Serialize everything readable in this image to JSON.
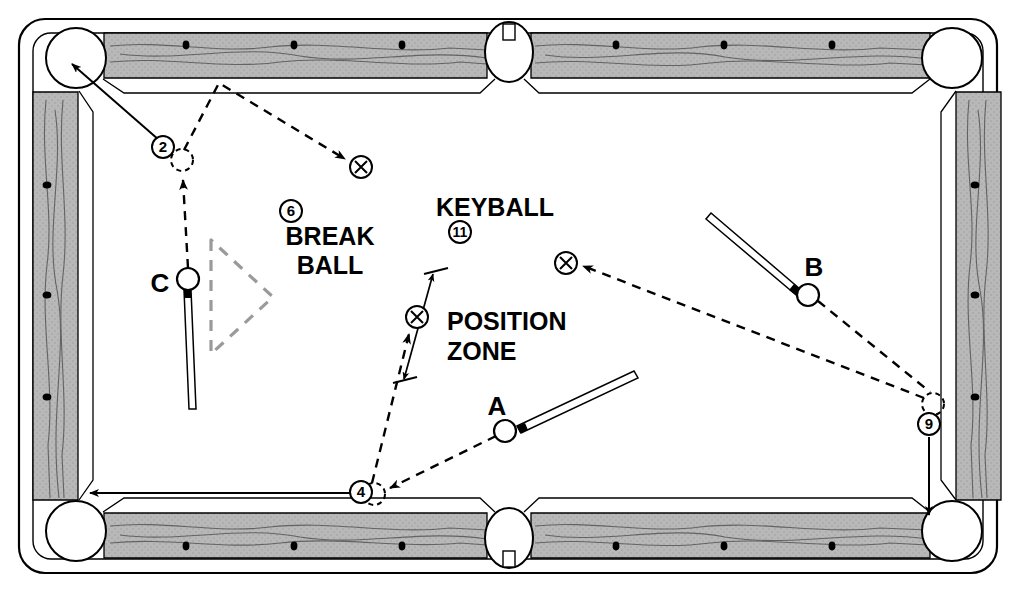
{
  "diagram": {
    "type": "pool-table-shot-diagram",
    "table": {
      "outer_frame": {
        "x": 18,
        "y": 18,
        "width": 980,
        "height": 556,
        "corner_radius": 26
      },
      "rail_color": "#b5b5b5",
      "cloth_color": "#ffffff",
      "line_color": "#000000",
      "pockets": [
        {
          "name": "top-left-corner",
          "cx": 76,
          "cy": 58,
          "r": 30
        },
        {
          "name": "top-side",
          "cx": 509,
          "cy": 50,
          "r": 23
        },
        {
          "name": "top-right-corner",
          "cx": 952,
          "cy": 58,
          "r": 30
        },
        {
          "name": "bottom-left-corner",
          "cx": 76,
          "cy": 531,
          "r": 30
        },
        {
          "name": "bottom-side",
          "cx": 509,
          "cy": 541,
          "r": 23
        },
        {
          "name": "bottom-right-corner",
          "cx": 952,
          "cy": 531,
          "r": 30
        }
      ],
      "diamonds": {
        "top_y": 45,
        "bottom_y": 546,
        "left_x": 47,
        "right_x": 975,
        "top_x": [
          186,
          294,
          402,
          616,
          724,
          832
        ],
        "bottom_x": [
          186,
          294,
          402,
          616,
          724,
          832
        ],
        "left_y": [
          185,
          295,
          397
        ],
        "right_y": [
          185,
          295,
          397
        ]
      }
    },
    "labels": [
      {
        "name": "break-ball-label-line1",
        "text": "BREAK",
        "x": 330,
        "y": 245,
        "size": 25
      },
      {
        "name": "break-ball-label-line2",
        "text": "BALL",
        "x": 330,
        "y": 274,
        "size": 25
      },
      {
        "name": "keyball-label",
        "text": "KEYBALL",
        "x": 495,
        "y": 216,
        "size": 25
      },
      {
        "name": "position-zone-label-line1",
        "text": "POSITION",
        "x": 447,
        "y": 330,
        "size": 25
      },
      {
        "name": "position-zone-label-line2",
        "text": "ZONE",
        "x": 447,
        "y": 360,
        "size": 25
      },
      {
        "name": "cueball-label-a",
        "text": "A",
        "x": 497,
        "y": 415,
        "size": 26
      },
      {
        "name": "cueball-label-b",
        "text": "B",
        "x": 814,
        "y": 276,
        "size": 26
      },
      {
        "name": "cueball-label-c",
        "text": "C",
        "x": 160,
        "y": 292,
        "size": 26
      }
    ],
    "object_balls": [
      {
        "name": "object-ball-2",
        "number": "2",
        "cx": 163,
        "cy": 147,
        "r": 11
      },
      {
        "name": "object-ball-6-break-ball",
        "number": "6",
        "cx": 291,
        "cy": 211,
        "r": 11
      },
      {
        "name": "object-ball-11-keyball",
        "number": "11",
        "cx": 460,
        "cy": 232,
        "r": 11
      },
      {
        "name": "object-ball-4",
        "number": "4",
        "cx": 361,
        "cy": 492,
        "r": 11
      },
      {
        "name": "object-ball-9",
        "number": "9",
        "cx": 929,
        "cy": 424,
        "r": 11
      }
    ],
    "cue_balls": [
      {
        "name": "cue-ball-a",
        "label": "A",
        "cx": 505,
        "cy": 431,
        "r": 11
      },
      {
        "name": "cue-ball-b",
        "label": "B",
        "cx": 808,
        "cy": 295,
        "r": 11
      },
      {
        "name": "cue-ball-c",
        "label": "C",
        "cx": 188,
        "cy": 279,
        "r": 11
      }
    ],
    "ghost_balls_x": [
      {
        "name": "ghost-ball-x-top",
        "cx": 361,
        "cy": 167,
        "r": 11
      },
      {
        "name": "ghost-ball-x-position-zone",
        "cx": 417,
        "cy": 317,
        "r": 11
      },
      {
        "name": "ghost-ball-x-right",
        "cx": 566,
        "cy": 263,
        "r": 11
      }
    ],
    "ghost_ball_outlines": [
      {
        "name": "ghost-outline-near-2",
        "cx": 182,
        "cy": 160,
        "r": 11
      },
      {
        "name": "ghost-outline-near-4",
        "cx": 374,
        "cy": 494,
        "r": 11
      },
      {
        "name": "ghost-outline-near-9",
        "cx": 933,
        "cy": 404,
        "r": 11
      }
    ],
    "cue_sticks": [
      {
        "name": "cue-stick-a",
        "x1": 515,
        "y1": 425,
        "x2": 628,
        "y2": 372
      },
      {
        "name": "cue-stick-b",
        "x1": 800,
        "y1": 288,
        "x2": 713,
        "y2": 216
      },
      {
        "name": "cue-stick-c",
        "x1": 188,
        "y1": 290,
        "x2": 193,
        "y2": 408
      }
    ],
    "rack_triangle": {
      "name": "rack-outline-triangle",
      "points": "211,240 211,354 273,297",
      "style": "dashed"
    },
    "solid_shot_arrows": [
      {
        "name": "shot-arrow-2-to-corner",
        "x1": 160,
        "y1": 140,
        "x2": 70,
        "y2": 63
      },
      {
        "name": "shot-arrow-4-to-corner",
        "x1": 350,
        "y1": 494,
        "x2": 88,
        "y2": 494
      },
      {
        "name": "shot-arrow-9-to-corner",
        "x1": 929,
        "y1": 436,
        "x2": 930,
        "y2": 518
      }
    ],
    "dashed_paths": [
      {
        "name": "path-2-ghost-to-apex",
        "points": "182,150 219,83 348,160"
      },
      {
        "name": "path-c-to-2-ghost",
        "points": "188,268 182,176"
      },
      {
        "name": "path-4-to-position-zone",
        "points": "372,484 411,331"
      },
      {
        "name": "path-a-to-4",
        "points": "497,435 385,489"
      },
      {
        "name": "path-b-to-9",
        "points": "818,300 932,394"
      },
      {
        "name": "path-9-to-ghost-x",
        "points": "925,396 580,266"
      }
    ],
    "position_zone_dimension": {
      "name": "position-zone-dimension-arrow",
      "x1": 404,
      "y1": 380,
      "x2": 434,
      "y2": 272,
      "tick1": {
        "x1": 393,
        "y1": 382,
        "x2": 417,
        "y2": 377
      },
      "tick2": {
        "x1": 424,
        "y1": 274,
        "x2": 448,
        "y2": 269
      }
    }
  }
}
